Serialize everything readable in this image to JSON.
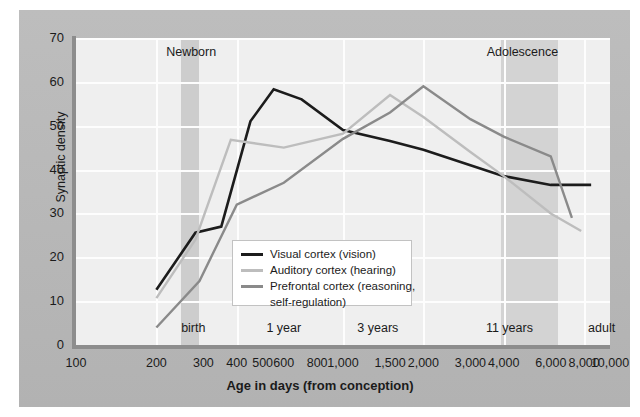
{
  "chart_data": {
    "type": "line",
    "title": "",
    "xlabel": "Age in days (from conception)",
    "ylabel": "Synaptic density",
    "xscale": "log",
    "xlim": [
      100,
      10000
    ],
    "ylim": [
      0,
      70
    ],
    "grid": true,
    "legend_position": "center",
    "yticks": [
      0,
      10,
      20,
      30,
      40,
      50,
      60,
      70
    ],
    "ytick_labels": [
      "0",
      "10",
      "20",
      "30",
      "40",
      "50",
      "60",
      "70"
    ],
    "xticks": [
      100,
      200,
      300,
      400,
      500,
      600,
      800,
      1000,
      1500,
      2000,
      3000,
      4000,
      6000,
      8000,
      10000
    ],
    "xtick_labels": [
      "100",
      "200",
      "300",
      "400",
      "500",
      "600",
      "800",
      "1,000",
      "1,500",
      "2,000",
      "3,000",
      "4,000",
      "6,000",
      "8,000",
      "10,000"
    ],
    "annotations_top": [
      {
        "label": "Newborn",
        "x": 270
      },
      {
        "label": "Adolescence",
        "x": 4700
      }
    ],
    "annotations_bottom": [
      {
        "label": "birth",
        "x": 275
      },
      {
        "label": "1 year",
        "x": 600
      },
      {
        "label": "3 years",
        "x": 1350
      },
      {
        "label": "11 years",
        "x": 4200
      },
      {
        "label": "adult",
        "x": 9300
      }
    ],
    "shaded_bands": [
      {
        "label": "birth",
        "x0": 248,
        "x1": 290,
        "color": "#cdcdcd"
      },
      {
        "label": "adolescence",
        "x0": 3900,
        "x1": 6400,
        "color": "#d3d3d3"
      }
    ],
    "series": [
      {
        "name": "Visual cortex (vision)",
        "color": "#1c1c1c",
        "x": [
          200,
          280,
          350,
          450,
          550,
          700,
          1000,
          1500,
          2000,
          3000,
          4000,
          6000,
          8500
        ],
        "y": [
          12.6,
          25.6,
          27.0,
          51.0,
          58.3,
          56.0,
          49.0,
          46.5,
          44.5,
          41.0,
          38.5,
          36.5,
          36.5
        ]
      },
      {
        "name": "Auditory cortex (hearing)",
        "color": "#bdbdbd",
        "x": [
          200,
          280,
          380,
          600,
          1000,
          1500,
          2000,
          3000,
          4000,
          6000,
          7800
        ],
        "y": [
          10.7,
          24.0,
          46.8,
          45.0,
          48.2,
          57.0,
          52.0,
          44.0,
          38.5,
          30.0,
          26.0
        ]
      },
      {
        "name": "Prefrontal cortex (reasoning, self-regulation)",
        "color": "#8a8a8a",
        "x": [
          200,
          290,
          400,
          600,
          1000,
          1500,
          2000,
          3000,
          4000,
          6000,
          7200
        ],
        "y": [
          4.0,
          14.6,
          32.0,
          37.0,
          47.0,
          53.0,
          59.0,
          51.5,
          47.5,
          43.0,
          29.0
        ]
      }
    ]
  },
  "legend": {
    "items": [
      {
        "label": "Visual cortex (vision)",
        "color": "#1c1c1c"
      },
      {
        "label": "Auditory cortex (hearing)",
        "color": "#bdbdbd"
      },
      {
        "label": "Prefrontal cortex (reasoning,",
        "color": "#8a8a8a"
      }
    ],
    "continuation": "self-regulation)"
  },
  "colors": {
    "panel": "#b9b9b9",
    "plot": "#efefef",
    "grid": "#fdfdfd",
    "axis": "#8d8d8d",
    "band": "#d3d3d3"
  }
}
